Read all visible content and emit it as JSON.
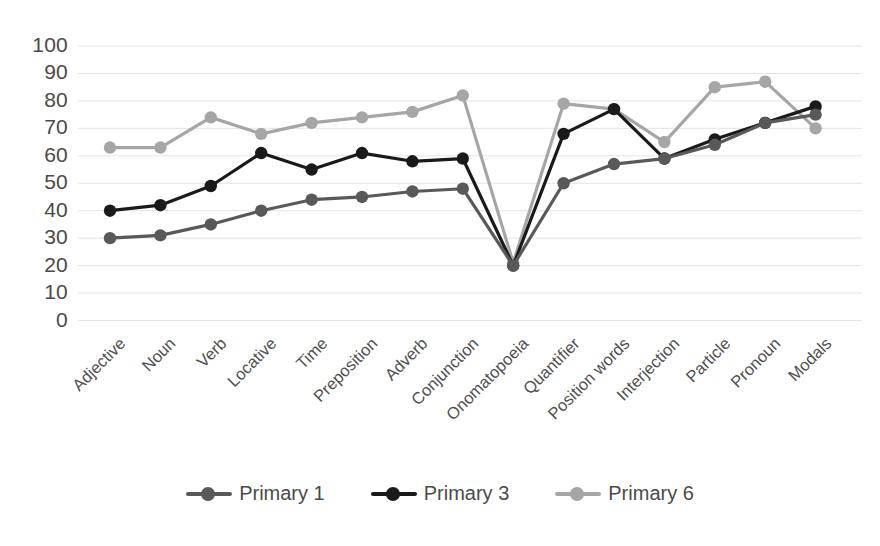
{
  "chart_data": {
    "type": "line",
    "title": "",
    "xlabel": "",
    "ylabel": "",
    "ylim": [
      0,
      100
    ],
    "ytick_step": 10,
    "yticks": [
      "0",
      "10",
      "20",
      "30",
      "40",
      "50",
      "60",
      "70",
      "80",
      "90",
      "100"
    ],
    "grid": true,
    "legend_position": "bottom",
    "categories": [
      "Adjective",
      "Noun",
      "Verb",
      "Locative",
      "Time",
      "Preposition",
      "Adverb",
      "Conjunction",
      "Onomatopoeia",
      "Quantifier",
      "Position words",
      "Interjection",
      "Particle",
      "Pronoun",
      "Modals"
    ],
    "series": [
      {
        "name": "Primary 1",
        "color": "#595959",
        "values": [
          30,
          31,
          35,
          40,
          44,
          45,
          47,
          48,
          20,
          50,
          57,
          59,
          64,
          72,
          75
        ]
      },
      {
        "name": "Primary 3",
        "color": "#1a1a1a",
        "values": [
          40,
          42,
          49,
          61,
          55,
          61,
          58,
          59,
          20,
          68,
          77,
          59,
          66,
          72,
          78
        ]
      },
      {
        "name": "Primary 6",
        "color": "#a6a6a6",
        "values": [
          63,
          63,
          74,
          68,
          72,
          74,
          76,
          82,
          21,
          79,
          77,
          65,
          85,
          87,
          70
        ]
      }
    ]
  },
  "legend": {
    "entries": [
      {
        "label": "Primary 1",
        "color": "#595959"
      },
      {
        "label": "Primary 3",
        "color": "#1a1a1a"
      },
      {
        "label": "Primary 6",
        "color": "#a6a6a6"
      }
    ]
  },
  "colors": {
    "grid": "#e4e4e4",
    "text": "#4a4a4a",
    "background": "#ffffff"
  }
}
